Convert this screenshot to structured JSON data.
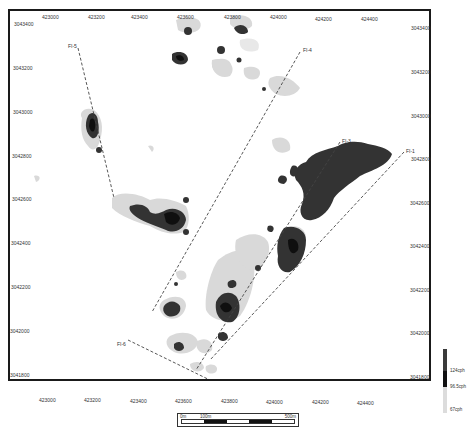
{
  "map": {
    "type": "radiometric survey contour map",
    "x_axis_ticks_top": [
      "423000",
      "423200",
      "423400",
      "423600",
      "423800",
      "424000",
      "424200",
      "424400"
    ],
    "x_axis_ticks_bottom": [
      "423000",
      "423200",
      "423400",
      "423600",
      "423800",
      "424000",
      "424200",
      "424400"
    ],
    "y_axis_ticks_left": [
      "3043400",
      "3043200",
      "3043000",
      "3042800",
      "3042600",
      "3042400",
      "3042200",
      "3042000",
      "3041800"
    ],
    "y_axis_ticks_right": [
      "3043400",
      "3043200",
      "3043000",
      "3042800",
      "3042600",
      "3042400",
      "3042200",
      "3042000",
      "3041800"
    ],
    "flight_lines": [
      {
        "label": "FI-5"
      },
      {
        "label": "FI-4"
      },
      {
        "label": "FI-3"
      },
      {
        "label": "FI-1"
      },
      {
        "label": "FI-6"
      }
    ]
  },
  "scale_bar": {
    "start_label": "0m",
    "mid_label": "100m",
    "end_label": "500m"
  },
  "legend": {
    "items": [
      {
        "label": "124cph",
        "color": "#3a3a3a"
      },
      {
        "label": "96.5cph",
        "color": "#111111"
      },
      {
        "label": "67cph",
        "color": "#dcdcdc"
      }
    ]
  },
  "colors": {
    "high": "#333333",
    "very_high": "#0f0f0f",
    "low": "#d9d9d9",
    "frame": "#1a1a1a",
    "flight_line": "#444444"
  }
}
